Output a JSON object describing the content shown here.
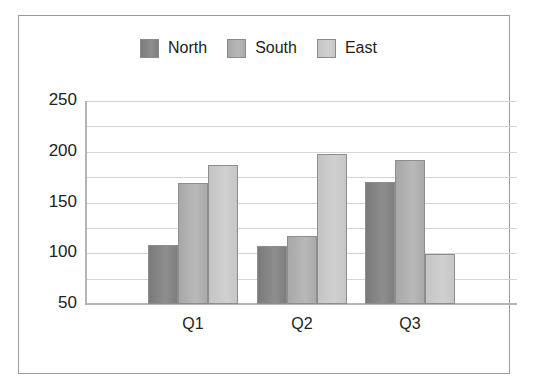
{
  "chart_data": {
    "type": "bar",
    "title": "",
    "xlabel": "",
    "ylabel": "",
    "categories": [
      "Q1",
      "Q2",
      "Q3"
    ],
    "series": [
      {
        "name": "North",
        "color": "#858585",
        "values": [
          108,
          107,
          170
        ]
      },
      {
        "name": "South",
        "color": "#b0b0b0",
        "values": [
          169,
          117,
          192
        ]
      },
      {
        "name": "East",
        "color": "#cbcbcb",
        "values": [
          187,
          198,
          99
        ]
      }
    ],
    "ylim": [
      50,
      250
    ],
    "yticks": [
      50,
      100,
      150,
      200,
      250
    ],
    "minor_grid_step": 25,
    "grid": true,
    "legend_position": "top"
  }
}
